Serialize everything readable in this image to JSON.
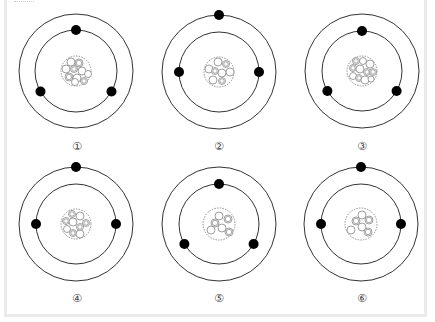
{
  "diagram": {
    "type": "bohr-atom-models",
    "colors": {
      "orbit": "#333333",
      "electron": "#000000",
      "nucleus_border": "#777777",
      "particle": "#888888",
      "border": "#ebebeb"
    },
    "atoms": [
      {
        "label": "①",
        "cx": 76,
        "cy": 71,
        "outer_r": 57,
        "inner_r": 41,
        "nucleus_r": 15,
        "electrons": [
          {
            "orbit": "inner",
            "angle": 90
          },
          {
            "orbit": "inner",
            "angle": 210
          },
          {
            "orbit": "inner",
            "angle": 330
          }
        ],
        "particles": [
          {
            "dx": -5,
            "dy": -9,
            "r": 4,
            "type": "neutron"
          },
          {
            "dx": 3,
            "dy": -8,
            "r": 4,
            "type": "proton"
          },
          {
            "dx": -10,
            "dy": -2,
            "r": 4,
            "type": "neutron"
          },
          {
            "dx": -2,
            "dy": -2,
            "r": 3.5,
            "type": "proton"
          },
          {
            "dx": 6,
            "dy": 0,
            "r": 4,
            "type": "neutron"
          },
          {
            "dx": 12,
            "dy": 3,
            "r": 3.5,
            "type": "neutron"
          },
          {
            "dx": -7,
            "dy": 6,
            "r": 4,
            "type": "proton"
          },
          {
            "dx": 1,
            "dy": 7,
            "r": 4,
            "type": "neutron"
          },
          {
            "dx": 8,
            "dy": 10,
            "r": 3.5,
            "type": "proton"
          },
          {
            "dx": -1,
            "dy": 11,
            "r": 3.5,
            "type": "neutron"
          }
        ]
      },
      {
        "label": "②",
        "cx": 219,
        "cy": 72,
        "outer_r": 57,
        "inner_r": 40,
        "nucleus_r": 15,
        "electrons": [
          {
            "orbit": "outer",
            "angle": 90
          },
          {
            "orbit": "inner",
            "angle": 180
          },
          {
            "orbit": "inner",
            "angle": 0
          }
        ],
        "particles": [
          {
            "dx": -1,
            "dy": -10,
            "r": 4,
            "type": "neutron"
          },
          {
            "dx": 7,
            "dy": -8,
            "r": 3.5,
            "type": "proton"
          },
          {
            "dx": -10,
            "dy": -3,
            "r": 4,
            "type": "neutron"
          },
          {
            "dx": -4,
            "dy": -1,
            "r": 3.5,
            "type": "proton"
          },
          {
            "dx": 3,
            "dy": 1,
            "r": 4,
            "type": "neutron"
          },
          {
            "dx": 11,
            "dy": 0,
            "r": 4,
            "type": "neutron"
          },
          {
            "dx": -6,
            "dy": 8,
            "r": 4,
            "type": "neutron"
          },
          {
            "dx": 3,
            "dy": 9,
            "r": 3.5,
            "type": "proton"
          }
        ]
      },
      {
        "label": "③",
        "cx": 362,
        "cy": 71,
        "outer_r": 57,
        "inner_r": 40,
        "nucleus_r": 15,
        "electrons": [
          {
            "orbit": "inner",
            "angle": 90
          },
          {
            "orbit": "inner",
            "angle": 210
          },
          {
            "orbit": "inner",
            "angle": 330
          }
        ],
        "particles": [
          {
            "dx": -6,
            "dy": -10,
            "r": 3.5,
            "type": "proton"
          },
          {
            "dx": 1,
            "dy": -10,
            "r": 3.5,
            "type": "neutron"
          },
          {
            "dx": 8,
            "dy": -7,
            "r": 4,
            "type": "neutron"
          },
          {
            "dx": -9,
            "dy": -3,
            "r": 3.5,
            "type": "proton"
          },
          {
            "dx": -2,
            "dy": -2,
            "r": 4,
            "type": "neutron"
          },
          {
            "dx": 5,
            "dy": 1,
            "r": 3.5,
            "type": "proton"
          },
          {
            "dx": 11,
            "dy": 1,
            "r": 3.5,
            "type": "proton"
          },
          {
            "dx": -9,
            "dy": 5,
            "r": 3.5,
            "type": "neutron"
          },
          {
            "dx": -3,
            "dy": 7,
            "r": 3.5,
            "type": "proton"
          },
          {
            "dx": 3,
            "dy": 9,
            "r": 4,
            "type": "neutron"
          },
          {
            "dx": 9,
            "dy": 8,
            "r": 3,
            "type": "neutron"
          }
        ]
      },
      {
        "label": "④",
        "cx": 76,
        "cy": 224,
        "outer_r": 57,
        "inner_r": 40,
        "nucleus_r": 15,
        "electrons": [
          {
            "orbit": "outer",
            "angle": 90
          },
          {
            "orbit": "inner",
            "angle": 180
          },
          {
            "orbit": "inner",
            "angle": 0
          }
        ],
        "particles": [
          {
            "dx": -4,
            "dy": -10,
            "r": 3.5,
            "type": "proton"
          },
          {
            "dx": 4,
            "dy": -8,
            "r": 4,
            "type": "neutron"
          },
          {
            "dx": -10,
            "dy": -3,
            "r": 3.5,
            "type": "proton"
          },
          {
            "dx": -3,
            "dy": -2,
            "r": 4,
            "type": "neutron"
          },
          {
            "dx": 10,
            "dy": -1,
            "r": 3.5,
            "type": "proton"
          },
          {
            "dx": 4,
            "dy": 3,
            "r": 3.5,
            "type": "proton"
          },
          {
            "dx": -9,
            "dy": 5,
            "r": 3.5,
            "type": "neutron"
          },
          {
            "dx": -3,
            "dy": 9,
            "r": 3.5,
            "type": "proton"
          },
          {
            "dx": 4,
            "dy": 10,
            "r": 4,
            "type": "neutron"
          }
        ]
      },
      {
        "label": "⑤",
        "cx": 219,
        "cy": 224,
        "outer_r": 57,
        "inner_r": 40,
        "nucleus_r": 16,
        "electrons": [
          {
            "orbit": "inner",
            "angle": 90
          },
          {
            "orbit": "inner",
            "angle": 210
          },
          {
            "orbit": "inner",
            "angle": 330
          }
        ],
        "particles": [
          {
            "dx": 0,
            "dy": -8,
            "r": 4,
            "type": "neutron"
          },
          {
            "dx": 9,
            "dy": -5,
            "r": 4,
            "type": "proton"
          },
          {
            "dx": -4,
            "dy": -1,
            "r": 4,
            "type": "proton"
          },
          {
            "dx": 3,
            "dy": 4,
            "r": 4,
            "type": "neutron"
          },
          {
            "dx": -8,
            "dy": 6,
            "r": 4,
            "type": "neutron"
          },
          {
            "dx": 10,
            "dy": 8,
            "r": 4,
            "type": "proton"
          }
        ]
      },
      {
        "label": "⑥",
        "cx": 361,
        "cy": 224,
        "outer_r": 57,
        "inner_r": 40,
        "nucleus_r": 16,
        "electrons": [
          {
            "orbit": "outer",
            "angle": 90
          },
          {
            "orbit": "inner",
            "angle": 180
          },
          {
            "orbit": "inner",
            "angle": 0
          }
        ],
        "particles": [
          {
            "dx": 1,
            "dy": -9,
            "r": 4,
            "type": "neutron"
          },
          {
            "dx": 8,
            "dy": -4,
            "r": 4,
            "type": "proton"
          },
          {
            "dx": -5,
            "dy": -3,
            "r": 4,
            "type": "proton"
          },
          {
            "dx": 1,
            "dy": 3,
            "r": 4,
            "type": "neutron"
          },
          {
            "dx": -10,
            "dy": 6,
            "r": 4,
            "type": "neutron"
          },
          {
            "dx": 7,
            "dy": 8,
            "r": 4,
            "type": "proton"
          }
        ]
      }
    ],
    "label_positions": [
      {
        "x": 77,
        "y": 150
      },
      {
        "x": 219,
        "y": 150
      },
      {
        "x": 362,
        "y": 150
      },
      {
        "x": 77,
        "y": 302
      },
      {
        "x": 219,
        "y": 302
      },
      {
        "x": 362,
        "y": 302
      }
    ]
  }
}
